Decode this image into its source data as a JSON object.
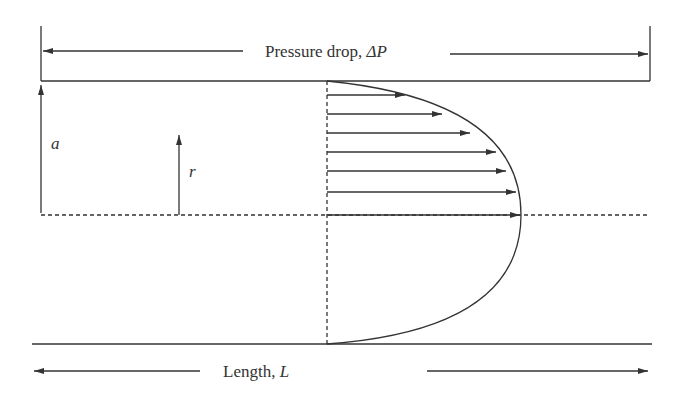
{
  "diagram": {
    "title_label": "Pressure drop, ",
    "title_symbol": "ΔP",
    "length_label": "Length, ",
    "length_symbol": "L",
    "radius_label": "a",
    "r_label": "r",
    "line_color": "#333333",
    "velocity_arrows": [
      {
        "y": 95,
        "tip_x": 405
      },
      {
        "y": 114,
        "tip_x": 442
      },
      {
        "y": 133,
        "tip_x": 470
      },
      {
        "y": 152,
        "tip_x": 496
      },
      {
        "y": 171,
        "tip_x": 506
      },
      {
        "y": 192,
        "tip_x": 516
      },
      {
        "y": 215,
        "tip_x": 520
      }
    ]
  }
}
